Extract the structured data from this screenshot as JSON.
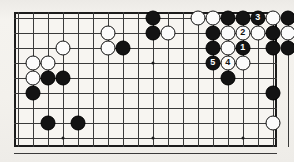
{
  "diagram": {
    "type": "go-board-diagram",
    "title": "",
    "board": {
      "columns": 18,
      "rows": 9,
      "cell_size": 15,
      "origin_x": 14,
      "origin_y": 12,
      "line_color": "#3a3a3a",
      "border_color": "#1c1c1c",
      "background_color": "#f7f5f1"
    },
    "hoshi": [
      {
        "col": 3,
        "row": 8
      },
      {
        "col": 9,
        "row": 3
      },
      {
        "col": 9,
        "row": 8
      },
      {
        "col": 15,
        "row": 8
      }
    ],
    "stones": [
      {
        "col": 9,
        "row": 0,
        "color": "black",
        "label": ""
      },
      {
        "col": 12,
        "row": 0,
        "color": "white",
        "label": ""
      },
      {
        "col": 13,
        "row": 0,
        "color": "white",
        "label": ""
      },
      {
        "col": 14,
        "row": 0,
        "color": "black",
        "label": ""
      },
      {
        "col": 15,
        "row": 0,
        "color": "black",
        "label": ""
      },
      {
        "col": 16,
        "row": 0,
        "color": "black",
        "label": "3"
      },
      {
        "col": 17,
        "row": 0,
        "color": "white",
        "label": ""
      },
      {
        "col": 18,
        "row": 0,
        "color": "black",
        "label": ""
      },
      {
        "col": 6,
        "row": 1,
        "color": "white",
        "label": ""
      },
      {
        "col": 9,
        "row": 1,
        "color": "black",
        "label": ""
      },
      {
        "col": 10,
        "row": 1,
        "color": "white",
        "label": ""
      },
      {
        "col": 13,
        "row": 1,
        "color": "black",
        "label": ""
      },
      {
        "col": 14,
        "row": 1,
        "color": "white",
        "label": ""
      },
      {
        "col": 15,
        "row": 1,
        "color": "white",
        "label": "2"
      },
      {
        "col": 16,
        "row": 1,
        "color": "white",
        "label": ""
      },
      {
        "col": 17,
        "row": 1,
        "color": "black",
        "label": ""
      },
      {
        "col": 18,
        "row": 1,
        "color": "white",
        "label": ""
      },
      {
        "col": 3,
        "row": 2,
        "color": "white",
        "label": ""
      },
      {
        "col": 6,
        "row": 2,
        "color": "white",
        "label": ""
      },
      {
        "col": 7,
        "row": 2,
        "color": "black",
        "label": ""
      },
      {
        "col": 13,
        "row": 2,
        "color": "black",
        "label": ""
      },
      {
        "col": 14,
        "row": 2,
        "color": "white",
        "label": ""
      },
      {
        "col": 15,
        "row": 2,
        "color": "black",
        "label": "1"
      },
      {
        "col": 17,
        "row": 2,
        "color": "black",
        "label": ""
      },
      {
        "col": 18,
        "row": 2,
        "color": "black",
        "label": ""
      },
      {
        "col": 19,
        "row": 2,
        "color": "black",
        "label": ""
      },
      {
        "col": 1,
        "row": 3,
        "color": "white",
        "label": ""
      },
      {
        "col": 2,
        "row": 3,
        "color": "white",
        "label": ""
      },
      {
        "col": 13,
        "row": 3,
        "color": "black",
        "label": "5"
      },
      {
        "col": 14,
        "row": 3,
        "color": "white",
        "label": "4"
      },
      {
        "col": 15,
        "row": 3,
        "color": "white",
        "label": ""
      },
      {
        "col": 1,
        "row": 4,
        "color": "white",
        "label": ""
      },
      {
        "col": 2,
        "row": 4,
        "color": "black",
        "label": ""
      },
      {
        "col": 3,
        "row": 4,
        "color": "black",
        "label": ""
      },
      {
        "col": 14,
        "row": 4,
        "color": "black",
        "label": ""
      },
      {
        "col": 1,
        "row": 5,
        "color": "black",
        "label": ""
      },
      {
        "col": 17,
        "row": 5,
        "color": "black",
        "label": ""
      },
      {
        "col": 19,
        "row": 5,
        "color": "black",
        "label": ""
      },
      {
        "col": 2,
        "row": 7,
        "color": "black",
        "label": ""
      },
      {
        "col": 4,
        "row": 7,
        "color": "black",
        "label": ""
      },
      {
        "col": 17,
        "row": 7,
        "color": "white",
        "label": ""
      },
      {
        "col": 19,
        "row": 7,
        "color": "white",
        "label": ""
      }
    ],
    "move_sequence": [
      {
        "number": "1",
        "color": "black"
      },
      {
        "number": "2",
        "color": "white"
      },
      {
        "number": "3",
        "color": "black"
      },
      {
        "number": "4",
        "color": "white"
      },
      {
        "number": "5",
        "color": "black"
      }
    ]
  }
}
